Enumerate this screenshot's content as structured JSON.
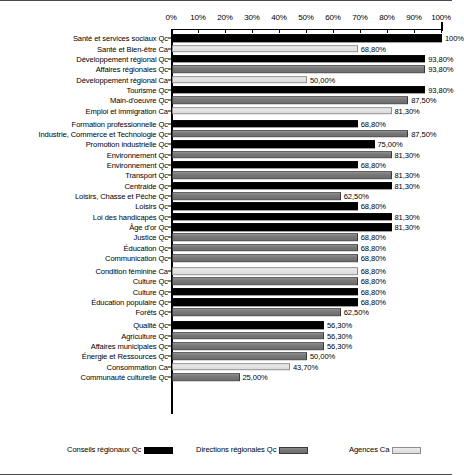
{
  "chart_data": {
    "type": "bar",
    "orientation": "horizontal",
    "title": "",
    "xlabel": "",
    "ylabel": "",
    "xlim": [
      0,
      100
    ],
    "grid": false,
    "legend_position": "bottom",
    "tick_labels": [
      "0%",
      "10%",
      "20%",
      "30%",
      "40%",
      "50%",
      "60%",
      "70%",
      "80%",
      "90%",
      "100%"
    ],
    "tick_values": [
      0,
      10,
      20,
      30,
      40,
      50,
      60,
      70,
      80,
      90,
      100
    ],
    "series_names": [
      "Conseils régionaux Qc",
      "Directions régionales Qc",
      "Agences Ca"
    ],
    "series_colors": [
      "#000000",
      "#777777",
      "#e2e2e2"
    ],
    "categories": [
      "Santé et services sociaux Qc",
      "Santé et Bien-être Ca",
      "Développement régional Qc",
      "Affaires régionales Qc",
      "Développement régional Ca",
      "Tourisme Qc",
      "Main-d'oeuvre Qc",
      "Emploi et immigration Ca",
      "Formation professionnelle Qc",
      "Industrie, Commerce et Technologie Qc",
      "Promotion industrielle Qc",
      "Environnement Qc",
      "Environnement Qc",
      "Transport Qc",
      "Centraide Qc",
      "Loisirs, Chasse et Pêche Qc",
      "Loisirs Qc",
      "Loi des handicapés Qc",
      "Âge d'or Qc",
      "Justice Qc",
      "Éducation Qc",
      "Communication Qc",
      "Condition féminine Ca",
      "Culture Qc",
      "Culture Qc",
      "Éducation populaire Qc",
      "Forêts Qc",
      "Qualité Qc",
      "Agriculture Qc",
      "Affaires municipales Qc",
      "Énergie et Ressources Qc",
      "Consommation Ca",
      "Communauté culturelle Qc"
    ],
    "values": [
      100.0,
      68.8,
      93.8,
      93.8,
      50.0,
      93.8,
      87.5,
      81.3,
      68.8,
      87.5,
      75.0,
      81.3,
      68.8,
      81.3,
      81.3,
      62.5,
      68.8,
      81.3,
      81.3,
      68.8,
      68.8,
      68.8,
      68.8,
      68.8,
      68.8,
      68.8,
      62.5,
      56.3,
      56.3,
      56.3,
      50.0,
      43.7,
      25.0
    ],
    "value_labels": [
      "100%",
      "68,80%",
      "93,80%",
      "93,80%",
      "50,00%",
      "93,80%",
      "87,50%",
      "81,30%",
      "68,80%",
      "87,50%",
      "75,00%",
      "81,30%",
      "68,80%",
      "81,30%",
      "81,30%",
      "62,50%",
      "68,80%",
      "81,30%",
      "81,30%",
      "68,80%",
      "68,80%",
      "68,80%",
      "68,80%",
      "68,80%",
      "68,80%",
      "68,80%",
      "62,50%",
      "56,30%",
      "56,30%",
      "56,30%",
      "50,00%",
      "43,70%",
      "25,00%"
    ],
    "series_index": [
      0,
      2,
      0,
      1,
      2,
      0,
      1,
      2,
      0,
      1,
      0,
      1,
      0,
      1,
      0,
      1,
      0,
      0,
      0,
      1,
      1,
      1,
      2,
      1,
      0,
      0,
      1,
      0,
      1,
      1,
      1,
      2,
      1
    ],
    "group_breaks": [
      8,
      22,
      27
    ]
  },
  "legend": {
    "items": [
      {
        "label": "Conseils régionaux Qc",
        "series": 0,
        "left": 67
      },
      {
        "label": "Directions régionales Qc",
        "series": 1,
        "left": 196
      },
      {
        "label": "Agences Ca",
        "series": 2,
        "left": 349
      }
    ]
  }
}
